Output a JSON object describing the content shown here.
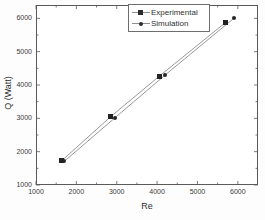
{
  "chart_data": {
    "type": "scatter",
    "title": "",
    "xlabel": "Re",
    "ylabel": "Q (Watt)",
    "xlim": [
      1000,
      6500
    ],
    "ylim": [
      1000,
      6400
    ],
    "xticks": [
      1000,
      2000,
      3000,
      4000,
      5000,
      6000
    ],
    "yticks": [
      1000,
      2000,
      3000,
      4000,
      5000,
      6000
    ],
    "xtick_labels": [
      "1000",
      "2000",
      "3000",
      "4000",
      "5000",
      "6000"
    ],
    "ytick_labels": [
      "1000",
      "2000",
      "3000",
      "4000",
      "5000",
      "6000"
    ],
    "grid": false,
    "minor_ticks": true,
    "legend_position": "top-center",
    "series": [
      {
        "name": "Experimental",
        "marker": "square",
        "color": "#232323",
        "line_color": "#9a9a9a",
        "x": [
          1640,
          2850,
          4050,
          5700
        ],
        "y": [
          1730,
          3050,
          4260,
          5880
        ]
      },
      {
        "name": "Simulation",
        "marker": "circle",
        "color": "#262626",
        "line_color": "#9a9a9a",
        "x": [
          1700,
          2950,
          4200,
          5900
        ],
        "y": [
          1710,
          3010,
          4300,
          6000
        ]
      }
    ]
  },
  "legend": {
    "entries": [
      {
        "label": "Experimental",
        "marker": "square"
      },
      {
        "label": "Simulation",
        "marker": "circle"
      }
    ]
  },
  "axes": {
    "x_title": "Re",
    "y_title": "Q (Watt)"
  }
}
